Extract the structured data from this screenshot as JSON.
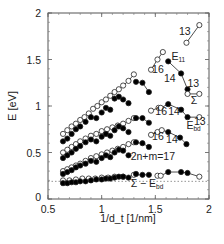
{
  "chart_data": {
    "type": "scatter",
    "title": "",
    "xlabel": "1/d_t [1/nm]",
    "ylabel": "E [eV]",
    "xlim": [
      0.5,
      2
    ],
    "ylim": [
      0,
      2
    ],
    "x_ticks": [
      "0.5",
      "1",
      "1.5",
      "2"
    ],
    "y_ticks": [
      "0",
      "0.5",
      "1",
      "1.5",
      "2"
    ],
    "grid": false,
    "legend": "none",
    "reference_line": {
      "y": 0.19,
      "style": "dotted"
    },
    "annotations": [
      {
        "text": "13",
        "x": 1.72,
        "y": 1.76
      },
      {
        "text": "E",
        "sub": "11",
        "x": 1.65,
        "y": 1.5
      },
      {
        "text": "16",
        "x": 1.47,
        "y": 1.36
      },
      {
        "text": "14",
        "x": 1.58,
        "y": 1.26
      },
      {
        "text": "13",
        "x": 1.8,
        "y": 1.2
      },
      {
        "text": "Σ",
        "x": 1.83,
        "y": 1.02
      },
      {
        "text": "16",
        "x": 1.5,
        "y": 0.9
      },
      {
        "text": "14",
        "x": 1.62,
        "y": 0.9
      },
      {
        "text": "13",
        "x": 1.86,
        "y": 0.8
      },
      {
        "text": "E",
        "sub": "bd",
        "x": 1.79,
        "y": 0.75
      },
      {
        "text": "16",
        "x": 1.47,
        "y": 0.63
      },
      {
        "text": "14",
        "x": 1.6,
        "y": 0.6
      },
      {
        "text": "2n+m=17",
        "x": 1.27,
        "y": 0.42
      },
      {
        "text": "Σ − E",
        "sub": "bd",
        "x": 1.27,
        "y": 0.13
      }
    ],
    "series": [
      {
        "name": "E11 (open, semiconducting branch)",
        "marker": "open-circle",
        "points": [
          [
            0.64,
            0.7
          ],
          [
            0.68,
            0.74
          ],
          [
            0.72,
            0.78
          ],
          [
            0.76,
            0.81
          ],
          [
            0.8,
            0.85
          ],
          [
            0.84,
            0.88
          ],
          [
            0.88,
            0.92
          ],
          [
            0.92,
            0.97
          ],
          [
            0.96,
            1.0
          ],
          [
            1.0,
            1.04
          ],
          [
            1.04,
            1.07
          ],
          [
            1.08,
            1.11
          ],
          [
            1.12,
            1.15
          ],
          [
            1.16,
            1.18
          ],
          [
            1.2,
            1.22
          ],
          [
            1.25,
            1.27
          ],
          [
            1.3,
            1.34
          ],
          [
            1.46,
            1.39
          ],
          [
            1.52,
            1.5
          ],
          [
            1.57,
            1.58
          ],
          [
            1.79,
            1.68
          ],
          [
            1.91,
            1.87
          ]
        ]
      },
      {
        "name": "E11 (filled)",
        "marker": "filled-circle",
        "points": [
          [
            0.64,
            0.62
          ],
          [
            0.68,
            0.65
          ],
          [
            0.72,
            0.7
          ],
          [
            0.76,
            0.75
          ],
          [
            0.8,
            0.78
          ],
          [
            0.85,
            0.83
          ],
          [
            0.9,
            0.88
          ],
          [
            0.95,
            0.87
          ],
          [
            1.0,
            0.93
          ],
          [
            1.04,
            0.98
          ],
          [
            1.08,
            0.96
          ],
          [
            1.12,
            1.08
          ],
          [
            1.16,
            1.1
          ],
          [
            1.2,
            1.07
          ],
          [
            1.25,
            1.03
          ],
          [
            1.32,
            1.26
          ],
          [
            1.38,
            1.25
          ],
          [
            1.44,
            1.15
          ],
          [
            1.62,
            1.48
          ],
          [
            1.74,
            1.35
          ],
          [
            1.8,
            1.18
          ]
        ]
      },
      {
        "name": "Σ (open)",
        "marker": "open-circle",
        "points": [
          [
            0.64,
            0.5
          ],
          [
            0.68,
            0.53
          ],
          [
            0.72,
            0.56
          ],
          [
            0.76,
            0.59
          ],
          [
            0.8,
            0.62
          ],
          [
            0.85,
            0.65
          ],
          [
            0.9,
            0.68
          ],
          [
            0.95,
            0.7
          ],
          [
            1.0,
            0.73
          ],
          [
            1.05,
            0.75
          ],
          [
            1.1,
            0.77
          ],
          [
            1.15,
            0.79
          ],
          [
            1.2,
            0.81
          ],
          [
            1.25,
            0.84
          ],
          [
            1.3,
            0.87
          ],
          [
            1.46,
            0.95
          ],
          [
            1.53,
            0.98
          ],
          [
            1.55,
            0.98
          ],
          [
            1.8,
            1.13
          ],
          [
            1.91,
            1.13
          ],
          [
            1.91,
            0.88
          ]
        ]
      },
      {
        "name": "Σ (filled)",
        "marker": "filled-circle",
        "points": [
          [
            0.64,
            0.44
          ],
          [
            0.68,
            0.47
          ],
          [
            0.72,
            0.5
          ],
          [
            0.76,
            0.54
          ],
          [
            0.8,
            0.57
          ],
          [
            0.85,
            0.61
          ],
          [
            0.9,
            0.64
          ],
          [
            0.95,
            0.62
          ],
          [
            1.0,
            0.67
          ],
          [
            1.04,
            0.7
          ],
          [
            1.08,
            0.68
          ],
          [
            1.12,
            0.74
          ],
          [
            1.16,
            0.78
          ],
          [
            1.2,
            0.76
          ],
          [
            1.25,
            0.72
          ],
          [
            1.32,
            0.87
          ],
          [
            1.38,
            0.87
          ],
          [
            1.44,
            0.82
          ],
          [
            1.62,
            1.02
          ],
          [
            1.74,
            0.96
          ],
          [
            1.8,
            0.88
          ]
        ]
      },
      {
        "name": "E_bd (open)",
        "marker": "open-circle",
        "points": [
          [
            0.64,
            0.3
          ],
          [
            0.68,
            0.32
          ],
          [
            0.72,
            0.34
          ],
          [
            0.76,
            0.36
          ],
          [
            0.8,
            0.38
          ],
          [
            0.85,
            0.41
          ],
          [
            0.9,
            0.44
          ],
          [
            0.95,
            0.46
          ],
          [
            1.0,
            0.48
          ],
          [
            1.05,
            0.5
          ],
          [
            1.1,
            0.52
          ],
          [
            1.15,
            0.54
          ],
          [
            1.2,
            0.56
          ],
          [
            1.25,
            0.59
          ],
          [
            1.3,
            0.61
          ],
          [
            1.46,
            0.69
          ],
          [
            1.52,
            0.72
          ],
          [
            1.56,
            0.74
          ]
        ]
      },
      {
        "name": "E_bd (filled)",
        "marker": "filled-circle",
        "points": [
          [
            0.64,
            0.27
          ],
          [
            0.68,
            0.29
          ],
          [
            0.72,
            0.31
          ],
          [
            0.76,
            0.34
          ],
          [
            0.8,
            0.36
          ],
          [
            0.85,
            0.38
          ],
          [
            0.9,
            0.41
          ],
          [
            0.95,
            0.4
          ],
          [
            1.0,
            0.44
          ],
          [
            1.04,
            0.47
          ],
          [
            1.08,
            0.45
          ],
          [
            1.12,
            0.5
          ],
          [
            1.16,
            0.53
          ],
          [
            1.2,
            0.52
          ],
          [
            1.25,
            0.47
          ],
          [
            1.32,
            0.61
          ],
          [
            1.38,
            0.6
          ],
          [
            1.44,
            0.56
          ],
          [
            1.62,
            0.72
          ],
          [
            1.73,
            0.66
          ],
          [
            1.79,
            0.59
          ]
        ]
      },
      {
        "name": "Σ − E_bd (open)",
        "marker": "open-circle",
        "points": [
          [
            0.64,
            0.2
          ],
          [
            0.7,
            0.2
          ],
          [
            0.76,
            0.21
          ],
          [
            0.82,
            0.22
          ],
          [
            0.88,
            0.22
          ],
          [
            0.94,
            0.22
          ],
          [
            1.0,
            0.23
          ],
          [
            1.06,
            0.23
          ],
          [
            1.12,
            0.24
          ],
          [
            1.2,
            0.24
          ],
          [
            1.3,
            0.26
          ],
          [
            1.52,
            0.25
          ],
          [
            1.55,
            0.25
          ],
          [
            1.91,
            0.24
          ]
        ]
      },
      {
        "name": "Σ − E_bd (filled)",
        "marker": "filled-circle",
        "points": [
          [
            0.64,
            0.17
          ],
          [
            0.68,
            0.17
          ],
          [
            0.72,
            0.18
          ],
          [
            0.76,
            0.18
          ],
          [
            0.8,
            0.19
          ],
          [
            0.85,
            0.19
          ],
          [
            0.9,
            0.2
          ],
          [
            0.95,
            0.21
          ],
          [
            1.0,
            0.21
          ],
          [
            1.04,
            0.22
          ],
          [
            1.08,
            0.22
          ],
          [
            1.12,
            0.23
          ],
          [
            1.16,
            0.24
          ],
          [
            1.2,
            0.24
          ],
          [
            1.25,
            0.23
          ],
          [
            1.32,
            0.27
          ],
          [
            1.38,
            0.26
          ],
          [
            1.44,
            0.26
          ],
          [
            1.62,
            0.29
          ],
          [
            1.74,
            0.29
          ],
          [
            1.8,
            0.28
          ]
        ]
      }
    ],
    "connected_segments": [
      [
        [
          1.79,
          1.68
        ],
        [
          1.91,
          1.87
        ]
      ],
      [
        [
          1.46,
          1.39
        ],
        [
          1.52,
          1.5
        ],
        [
          1.57,
          1.58
        ]
      ],
      [
        [
          1.62,
          1.48
        ],
        [
          1.74,
          1.35
        ],
        [
          1.8,
          1.18
        ],
        [
          1.8,
          1.13
        ],
        [
          1.91,
          1.13
        ]
      ],
      [
        [
          1.46,
          0.95
        ],
        [
          1.53,
          0.98
        ],
        [
          1.55,
          0.98
        ],
        [
          1.62,
          1.02
        ],
        [
          1.74,
          0.96
        ],
        [
          1.8,
          0.88
        ],
        [
          1.91,
          0.88
        ]
      ],
      [
        [
          1.46,
          0.69
        ],
        [
          1.52,
          0.72
        ],
        [
          1.56,
          0.74
        ],
        [
          1.62,
          0.72
        ],
        [
          1.73,
          0.66
        ],
        [
          1.79,
          0.59
        ]
      ],
      [
        [
          1.52,
          0.25
        ],
        [
          1.55,
          0.25
        ],
        [
          1.62,
          0.29
        ],
        [
          1.74,
          0.29
        ],
        [
          1.8,
          0.28
        ],
        [
          1.91,
          0.24
        ]
      ],
      [
        [
          1.2,
          1.22
        ],
        [
          1.25,
          1.27
        ],
        [
          1.3,
          1.34
        ]
      ],
      [
        [
          1.32,
          1.26
        ],
        [
          1.38,
          1.25
        ],
        [
          1.44,
          1.15
        ]
      ],
      [
        [
          1.25,
          0.84
        ],
        [
          1.3,
          0.87
        ],
        [
          1.38,
          0.87
        ],
        [
          1.44,
          0.82
        ]
      ],
      [
        [
          1.25,
          0.59
        ],
        [
          1.3,
          0.61
        ],
        [
          1.38,
          0.6
        ],
        [
          1.44,
          0.56
        ]
      ],
      [
        [
          1.3,
          0.26
        ],
        [
          1.38,
          0.26
        ],
        [
          1.44,
          0.26
        ]
      ]
    ]
  }
}
